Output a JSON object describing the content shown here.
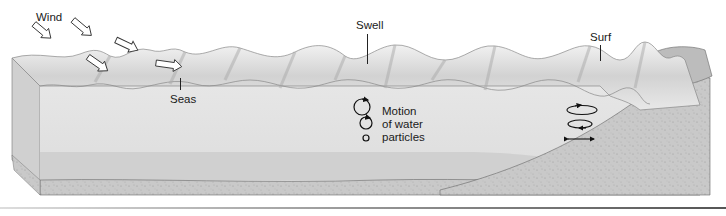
{
  "diagram": {
    "labels": {
      "wind": "Wind",
      "seas": "Seas",
      "swell": "Swell",
      "surf": "Surf",
      "motion_line1": "Motion",
      "motion_line2": "of water",
      "motion_line3": "particles"
    },
    "wind_arrows": 5,
    "swell_crests": 9,
    "particle_orbits": {
      "deep_water": [
        "large circle",
        "medium circle",
        "small circle"
      ],
      "shallow_water": [
        "flattened ellipse",
        "flatter ellipse",
        "back-and-forth line"
      ]
    },
    "colors": {
      "water_surface": "#d9d9d9",
      "water_body": "#e4e4e4",
      "deep_band": "#cfcfcf",
      "sediment": "#c4c4c4",
      "beach": "#bdbdbd",
      "outline": "#555555",
      "text": "#1a1a1a"
    }
  }
}
